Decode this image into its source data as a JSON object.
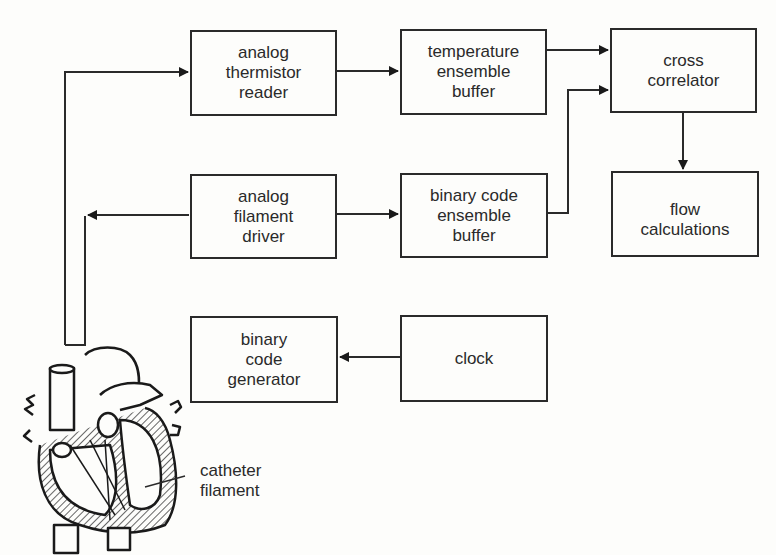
{
  "diagram": {
    "blocks": {
      "thermistor_reader": {
        "label": "analog\nthermistor\nreader"
      },
      "temperature_buffer": {
        "label": "temperature\nensemble\nbuffer"
      },
      "cross_correlator": {
        "label": "cross\ncorrelator\n "
      },
      "flow_calculations": {
        "label": "flow\ncalculations"
      },
      "filament_driver": {
        "label": "analog\nfilament\ndriver"
      },
      "binary_buffer": {
        "label": "binary code\nensemble\nbuffer"
      },
      "code_generator": {
        "label": "binary\ncode\ngenerator"
      },
      "clock": {
        "label": "clock"
      }
    },
    "annotations": {
      "catheter": "catheter\nfilament"
    },
    "connections": [
      {
        "from": "heart-catheter",
        "to": "thermistor_reader"
      },
      {
        "from": "thermistor_reader",
        "to": "temperature_buffer"
      },
      {
        "from": "temperature_buffer",
        "to": "cross_correlator"
      },
      {
        "from": "binary_buffer",
        "to": "cross_correlator"
      },
      {
        "from": "cross_correlator",
        "to": "flow_calculations"
      },
      {
        "from": "filament_driver",
        "to": "heart-catheter"
      },
      {
        "from": "filament_driver",
        "to": "binary_buffer"
      },
      {
        "from": "clock",
        "to": "code_generator"
      }
    ],
    "colors": {
      "stroke": "#2a2a2a",
      "background": "#fdfdfb"
    }
  }
}
